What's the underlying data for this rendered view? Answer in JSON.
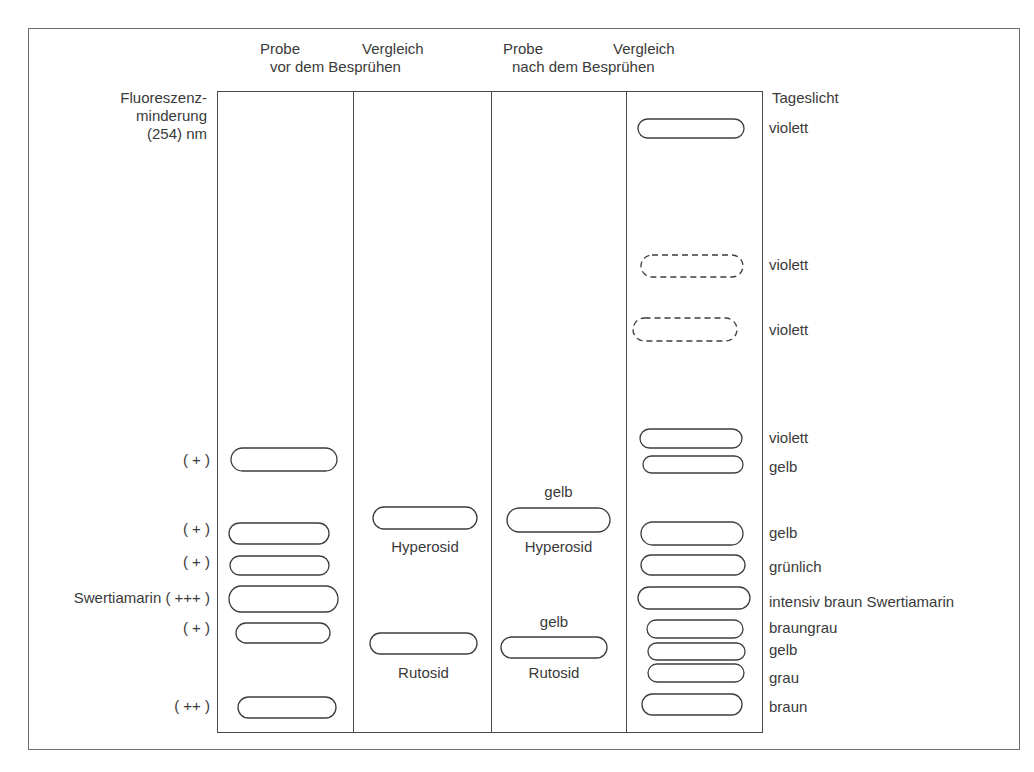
{
  "header": {
    "col1_top": "Probe",
    "col2_top": "Vergleich",
    "group1_bottom": "vor dem Besprühen",
    "col3_top": "Probe",
    "col4_top": "Vergleich",
    "group2_bottom": "nach dem Besprühen"
  },
  "left_axis": {
    "title_line1": "Fluoreszenz-",
    "title_line2": "minderung",
    "title_line3": "(254) nm",
    "labels": [
      {
        "text": "( + )",
        "y": 451
      },
      {
        "text": "( + )",
        "y": 520
      },
      {
        "text": "( + )",
        "y": 553
      },
      {
        "text": "Swertiamarin ( +++ )",
        "y": 589
      },
      {
        "text": "( + )",
        "y": 619
      },
      {
        "text": "( ++ )",
        "y": 697
      }
    ]
  },
  "right_axis": {
    "title": "Tageslicht",
    "labels": [
      {
        "text": "violett",
        "y": 119
      },
      {
        "text": "violett",
        "y": 256
      },
      {
        "text": "violett",
        "y": 321
      },
      {
        "text": "violett",
        "y": 429
      },
      {
        "text": "gelb",
        "y": 458
      },
      {
        "text": "gelb",
        "y": 524
      },
      {
        "text": "grünlich",
        "y": 558
      },
      {
        "text": "intensiv braun  Swertiamarin",
        "y": 593
      },
      {
        "text": "braungrau",
        "y": 619
      },
      {
        "text": "gelb",
        "y": 641
      },
      {
        "text": "grau",
        "y": 669
      },
      {
        "text": "braun",
        "y": 698
      }
    ]
  },
  "lanes": [
    {
      "name": "Probe vor dem Besprühen",
      "bands": [
        {
          "x": 231,
          "y": 448,
          "w": 106,
          "h": 23,
          "style": "solid"
        },
        {
          "x": 229,
          "y": 523,
          "w": 100,
          "h": 21,
          "style": "solid"
        },
        {
          "x": 230,
          "y": 556,
          "w": 99,
          "h": 19,
          "style": "solid"
        },
        {
          "x": 229,
          "y": 586,
          "w": 109,
          "h": 26,
          "style": "solid"
        },
        {
          "x": 236,
          "y": 623,
          "w": 94,
          "h": 20,
          "style": "solid"
        },
        {
          "x": 238,
          "y": 697,
          "w": 98,
          "h": 21,
          "style": "solid"
        }
      ]
    },
    {
      "name": "Vergleich vor dem Besprühen",
      "bands": [
        {
          "x": 373,
          "y": 507,
          "w": 104,
          "h": 22,
          "style": "solid",
          "label": "Hyperosid",
          "label_y": 538
        },
        {
          "x": 370,
          "y": 633,
          "w": 107,
          "h": 21,
          "style": "solid",
          "label": "Rutosid",
          "label_y": 664
        }
      ]
    },
    {
      "name": "Probe nach dem Besprühen",
      "bands": [
        {
          "x": 507,
          "y": 508,
          "w": 103,
          "h": 24,
          "style": "solid",
          "label_above": "gelb",
          "above_y": 483,
          "label": "Hyperosid",
          "label_y": 538
        },
        {
          "x": 501,
          "y": 637,
          "w": 106,
          "h": 21,
          "style": "solid",
          "label_above": "gelb",
          "above_y": 613,
          "label": "Rutosid",
          "label_y": 664
        }
      ]
    },
    {
      "name": "Vergleich nach dem Besprühen",
      "bands": [
        {
          "x": 638,
          "y": 119,
          "w": 106,
          "h": 19,
          "style": "solid"
        },
        {
          "x": 641,
          "y": 255,
          "w": 102,
          "h": 22,
          "style": "dashed"
        },
        {
          "x": 633,
          "y": 318,
          "w": 104,
          "h": 23,
          "style": "dashed"
        },
        {
          "x": 640,
          "y": 429,
          "w": 102,
          "h": 19,
          "style": "solid"
        },
        {
          "x": 643,
          "y": 456,
          "w": 100,
          "h": 17,
          "style": "solid"
        },
        {
          "x": 641,
          "y": 522,
          "w": 102,
          "h": 23,
          "style": "solid"
        },
        {
          "x": 641,
          "y": 555,
          "w": 104,
          "h": 20,
          "style": "solid"
        },
        {
          "x": 638,
          "y": 587,
          "w": 112,
          "h": 22,
          "style": "solid"
        },
        {
          "x": 647,
          "y": 620,
          "w": 96,
          "h": 18,
          "style": "solid"
        },
        {
          "x": 648,
          "y": 643,
          "w": 97,
          "h": 17,
          "style": "solid"
        },
        {
          "x": 648,
          "y": 664,
          "w": 96,
          "h": 18,
          "style": "solid"
        },
        {
          "x": 642,
          "y": 694,
          "w": 100,
          "h": 21,
          "style": "solid"
        }
      ]
    }
  ],
  "colors": {
    "line": "#3d3d3d",
    "text": "#3a3a3a",
    "frame": "#6e6e6e"
  }
}
